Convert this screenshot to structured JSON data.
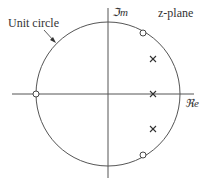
{
  "diagram": {
    "title": "z-plane",
    "unit_circle_label": "Unit circle",
    "imag_axis_label": "ℑm",
    "real_axis_label": "ℜe",
    "colors": {
      "line": "#555555",
      "marker": "#333333",
      "text": "#333333"
    },
    "zeros": [
      {
        "label": "zero-left",
        "x": 36,
        "y": 94
      },
      {
        "label": "zero-upper",
        "x": 143,
        "y": 33
      },
      {
        "label": "zero-lower",
        "x": 143,
        "y": 155
      }
    ],
    "poles": [
      {
        "label": "pole-upper",
        "x": 153,
        "y": 59
      },
      {
        "label": "pole-real",
        "x": 153,
        "y": 94
      },
      {
        "label": "pole-lower",
        "x": 153,
        "y": 129
      }
    ]
  }
}
